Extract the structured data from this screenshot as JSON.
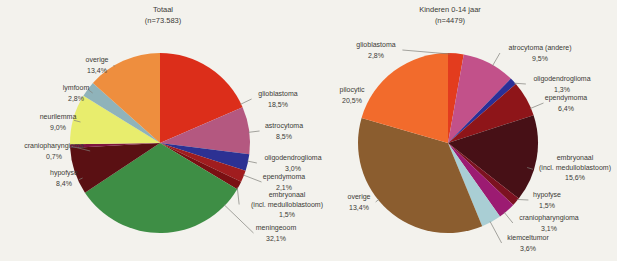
{
  "figure": {
    "background_color": "#f3f2ed",
    "text_color": "#3b3a36",
    "leader_line_color": "#807f7a"
  },
  "chart_data": [
    {
      "id": "totaal",
      "type": "pie",
      "title": "Totaal",
      "subtitle": "(n=73.583)",
      "title_x": 163,
      "pie": {
        "cx": 160,
        "cy": 143,
        "r": 90
      },
      "slices": [
        {
          "name": "glioblastoma",
          "pct": "18,5%",
          "value": 18.5,
          "color": "#dc2e1a",
          "label": {
            "x": 278,
            "y": 96,
            "lines": [
              "glioblastoma",
              "18,5%"
            ]
          }
        },
        {
          "name": "astrocytoma",
          "pct": "8,5%",
          "value": 8.5,
          "color": "#b45880",
          "label": {
            "x": 284,
            "y": 128,
            "lines": [
              "astrocytoma",
              "8,5%"
            ]
          }
        },
        {
          "name": "oligodendroglioma",
          "pct": "3,0%",
          "value": 3.0,
          "color": "#2c3193",
          "label": {
            "x": 293,
            "y": 160,
            "lines": [
              "oligodendroglioma",
              "3,0%"
            ]
          }
        },
        {
          "name": "ependymoma",
          "pct": "2,1%",
          "value": 2.1,
          "color": "#a01d1f",
          "label": {
            "x": 284,
            "y": 179,
            "lines": [
              "ependymoma",
              "2,1%"
            ]
          }
        },
        {
          "name": "embryonaal",
          "pct": "1,5%",
          "value": 1.5,
          "color": "#7a1013",
          "label": {
            "x": 287,
            "y": 197,
            "lines": [
              "embryonaal",
              "(incl. medulloblastoom)",
              "1,5%"
            ]
          }
        },
        {
          "name": "meningeoom",
          "pct": "32,1%",
          "value": 32.1,
          "color": "#3e8e45",
          "label": {
            "x": 276,
            "y": 230,
            "lines": [
              "meningeoom",
              "32,1%"
            ]
          }
        },
        {
          "name": "hypofyse",
          "pct": "8,4%",
          "value": 8.4,
          "color": "#5a1013",
          "label": {
            "x": 64,
            "y": 175,
            "lines": [
              "hypofyse",
              "8,4%"
            ]
          }
        },
        {
          "name": "craniopharyngioma",
          "pct": "0,7%",
          "value": 0.7,
          "color": "#7d1440",
          "label": {
            "x": 54,
            "y": 148,
            "lines": [
              "craniopharyngioma",
              "0,7%"
            ]
          }
        },
        {
          "name": "neurilemma",
          "pct": "9,0%",
          "value": 9.0,
          "color": "#e8ed6d",
          "label": {
            "x": 58,
            "y": 119,
            "lines": [
              "neurilemma",
              "9,0%"
            ]
          }
        },
        {
          "name": "lymfoom",
          "pct": "2,8%",
          "value": 2.8,
          "color": "#8fb3ba",
          "label": {
            "x": 76,
            "y": 90,
            "lines": [
              "lymfoom",
              "2,8%"
            ]
          }
        },
        {
          "name": "overige",
          "pct": "13,4%",
          "value": 13.4,
          "color": "#ee8e3e",
          "label": {
            "x": 97,
            "y": 62,
            "lines": [
              "overige",
              "13,4%"
            ]
          }
        }
      ]
    },
    {
      "id": "kinderen-0-14",
      "type": "pie",
      "title": "Kinderen 0-14 jaar",
      "subtitle": "(n=4479)",
      "title_x": 450,
      "pie": {
        "cx": 448,
        "cy": 143,
        "r": 90
      },
      "slices": [
        {
          "name": "glioblastoma",
          "pct": "2,8%",
          "value": 2.8,
          "color": "#e33c1e",
          "label": {
            "x": 376,
            "y": 47,
            "lines": [
              "glioblastoma",
              "2,8%"
            ]
          }
        },
        {
          "name": "atrocytoma-andere",
          "pct": "9,5%",
          "value": 9.5,
          "color": "#c2518a",
          "label": {
            "x": 540,
            "y": 50,
            "lines": [
              "atrocytoma (andere)",
              "9,5%"
            ]
          }
        },
        {
          "name": "oligodendroglioma",
          "pct": "1,3%",
          "value": 1.3,
          "color": "#2b2f97",
          "label": {
            "x": 562,
            "y": 81,
            "lines": [
              "oligodendroglioma",
              "1,3%"
            ]
          }
        },
        {
          "name": "ependymoma",
          "pct": "6,4%",
          "value": 6.4,
          "color": "#8e1519",
          "label": {
            "x": 566,
            "y": 100,
            "lines": [
              "ependymoma",
              "6,4%"
            ]
          }
        },
        {
          "name": "embryonaal",
          "pct": "15,6%",
          "value": 15.6,
          "color": "#471016",
          "label": {
            "x": 575,
            "y": 160,
            "lines": [
              "embryonaal",
              "(incl. medulloblastoom)",
              "15,6%"
            ]
          }
        },
        {
          "name": "hypofyse",
          "pct": "1,5%",
          "value": 1.5,
          "color": "#7c1220",
          "label": {
            "x": 547,
            "y": 197,
            "lines": [
              "hypofyse",
              "1,5%"
            ]
          }
        },
        {
          "name": "craniopharyngioma",
          "pct": "3,1%",
          "value": 3.1,
          "color": "#9c1b72",
          "label": {
            "x": 549,
            "y": 220,
            "lines": [
              "craniopharyngioma",
              "3,1%"
            ]
          }
        },
        {
          "name": "kiemceltumor",
          "pct": "3,6%",
          "value": 3.6,
          "color": "#a9ced4",
          "label": {
            "x": 528,
            "y": 240,
            "lines": [
              "kiemceltumor",
              "3,6%"
            ]
          }
        },
        {
          "name": "overige",
          "pct": "13,4%",
          "value": 13.4,
          "drawn_value": 35.7,
          "color": "#8b5d2f",
          "label": {
            "x": 359,
            "y": 199,
            "lines": [
              "overige",
              "13,4%"
            ]
          }
        },
        {
          "name": "pilocytic",
          "pct": "20,5%",
          "value": 20.5,
          "color": "#f26b2c",
          "label": {
            "x": 352,
            "y": 92,
            "lines": [
              "pilocytic",
              "20,5%"
            ]
          }
        }
      ]
    }
  ]
}
